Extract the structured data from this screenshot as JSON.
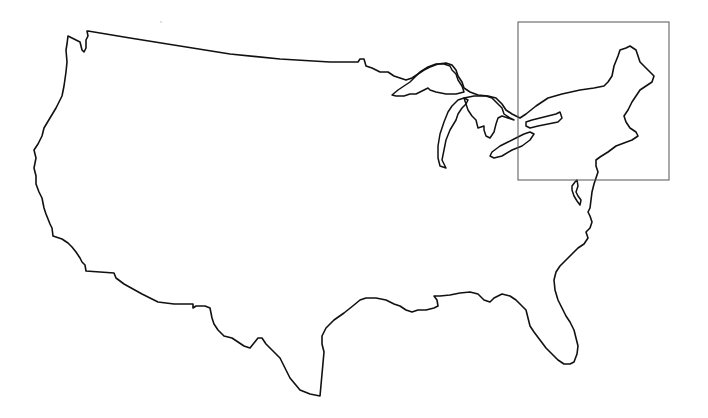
{
  "map": {
    "title": "Contiguous United States outline map",
    "colors": {
      "background": "#ffffff",
      "outline": "#111111",
      "inset_frame": "#555555"
    },
    "inset_frame": {
      "label": "Northeast region highlight",
      "x": 518,
      "y": 22,
      "width": 151,
      "height": 158
    },
    "paths": {
      "mainland": "M 88 31 L 130 38 L 180 46 L 230 54 L 280 59 L 330 62 L 358 62 L 360 59 L 364 59 L 366 66 L 372 68 L 380 72 L 388 72 L 394 76 L 400 78 L 406 80 L 412 78 L 418 74 L 424 70 L 430 67 L 438 64 L 446 63 L 452 65 L 456 70 L 458 76 L 462 82 L 464 88 L 470 92 L 478 95 L 488 96 L 496 98 L 502 104 L 506 110 L 512 114 L 516 116 L 520 118 L 526 114 L 536 106 L 548 98 L 562 94 L 580 90 L 594 88 L 604 86 L 608 82 L 612 76 L 614 66 L 618 56 L 620 50 L 626 48 L 630 46 L 636 50 L 640 62 L 646 68 L 650 72 L 654 76 L 652 82 L 646 86 L 640 90 L 636 96 L 632 102 L 628 110 L 624 116 L 626 122 L 630 128 L 636 132 L 638 136 L 632 140 L 624 143 L 616 146 L 608 152 L 600 157 L 596 160 L 596 166 L 598 172 L 596 178 L 594 184 L 592 192 L 591 200 L 590 208 L 588 212 L 590 216 L 592 222 L 590 228 L 586 232 L 588 238 L 584 244 L 578 248 L 572 254 L 566 260 L 560 266 L 556 272 L 554 280 L 555 290 L 558 300 L 562 308 L 566 316 L 570 322 L 574 330 L 576 338 L 578 346 L 577 354 L 574 362 L 570 364 L 564 364 L 558 360 L 552 354 L 546 348 L 540 340 L 534 332 L 530 326 L 528 318 L 526 310 L 522 306 L 516 300 L 510 296 L 502 294 L 494 298 L 490 302 L 484 300 L 478 294 L 470 292 L 460 293 L 450 295 L 440 296 L 434 296 L 437 300 L 438 306 L 434 308 L 426 310 L 418 310 L 412 312 L 406 310 L 400 306 L 394 304 L 386 300 L 376 298 L 366 298 L 360 300 L 354 305 L 344 313 L 334 320 L 326 328 L 322 336 L 322 344 L 324 352 L 320 396 L 310 394 L 300 390 L 290 378 L 284 366 L 280 358 L 272 350 L 266 344 L 262 338 L 258 338 L 254 343 L 250 348 L 244 346 L 238 342 L 232 338 L 224 336 L 218 330 L 214 324 L 212 318 L 210 308 L 205 306 L 196 306 L 193 308 L 193 304 L 174 304 L 158 302 L 150 298 L 142 294 L 124 284 L 116 278 L 114 273 L 100 272 L 86 271 L 85 265 L 82 262 L 80 258 L 76 252 L 72 247 L 68 243 L 62 239 L 56 237 L 53 236 L 52 228 L 50 224 L 46 214 L 44 208 L 42 198 L 39 192 L 36 184 L 36 176 L 34 168 L 36 158 L 34 150 L 38 144 L 42 136 L 44 128 L 50 118 L 56 108 L 62 96 L 64 86 L 66 72 L 67 62 L 66 50 L 67 44 L 68 36 L 72 38 L 76 40 L 80 42 L 82 50 L 84 52 L 86 48 L 86 40 L 88 36 L 87 31 Z",
      "lake_superior": "M 392 95 L 398 90 L 404 86 L 410 82 L 416 76 L 420 72 L 428 67 L 436 64 L 444 64 L 450 66 L 452 70 L 456 74 L 458 80 L 462 86 L 464 92 L 456 94 L 446 94 L 436 92 L 430 90 L 428 88 L 424 90 L 420 92 L 416 94 L 410 94 L 404 96 L 396 96 L 392 95 Z",
      "lake_michigan": "M 452 106 L 458 100 L 464 98 L 468 100 L 466 104 L 462 108 L 458 114 L 456 120 L 450 130 L 446 140 L 444 150 L 442 160 L 446 168 L 440 166 L 438 158 L 438 146 L 440 134 L 444 122 L 448 112 Z",
      "lake_huron": "M 464 98 L 474 96 L 486 96 L 492 98 L 498 104 L 502 108 L 504 114 L 510 118 L 514 120 L 508 118 L 502 116 L 498 118 L 496 124 L 494 132 L 490 138 L 486 136 L 484 130 L 484 126 L 478 128 L 476 120 L 472 116 L 468 110 L 466 104 Z",
      "lake_erie": "M 492 152 L 500 146 L 508 142 L 516 138 L 524 134 L 530 132 L 534 134 L 530 140 L 522 146 L 512 150 L 502 156 L 494 158 L 490 156 Z",
      "lake_ontario": "M 526 122 L 532 120 L 540 118 L 548 116 L 556 114 L 560 112 L 562 118 L 558 122 L 548 124 L 538 126 L 530 128 L 526 126 Z",
      "chesapeake": "M 575 182 L 577 180 L 578 186 L 576 192 L 578 196 L 581 200 L 580 205 L 577 201 L 574 196 L 572 190 L 572 186 Z"
    },
    "labels": []
  }
}
